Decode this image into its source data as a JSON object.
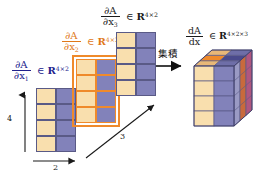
{
  "figure": {
    "type": "tensor-derivative-diagram",
    "background": "#ffffff",
    "colors": {
      "cell_tan": "#f9dfae",
      "cell_purple": "#8282ba",
      "cell_border": "#5a5a86",
      "label_blue": "#20208c",
      "label_orange": "#e07818",
      "highlight_orange": "#ef8a2b",
      "arrow_black": "#1a1a1a"
    }
  },
  "labels": {
    "slice1": {
      "num": "∂A",
      "den_d": "∂x",
      "den_sub": "1",
      "in": "∈",
      "set": "R",
      "dims": "4×2",
      "color": "#20208c"
    },
    "slice2": {
      "num": "∂A",
      "den_d": "∂x",
      "den_sub": "2",
      "in": "∈",
      "set": "R",
      "dims": "4×2",
      "color": "#e07818"
    },
    "slice3": {
      "num": "∂A",
      "den_d": "∂x",
      "den_sub": "3",
      "in": "∈",
      "set": "R",
      "dims": "4×2",
      "color": "#1a1a1a"
    },
    "tensor": {
      "num": "dA",
      "den": "dx",
      "in": "∈",
      "set": "R",
      "dims": "4×2×3",
      "color": "#1a1a1a"
    }
  },
  "operation": {
    "name": "accumulate-arrow",
    "text": "集積"
  },
  "axes": [
    {
      "name": "vertical-axis",
      "label": "4",
      "direction": "up"
    },
    {
      "name": "horizontal-axis",
      "label": "2",
      "direction": "right"
    },
    {
      "name": "depth-axis",
      "label": "3",
      "direction": "up-right"
    }
  ],
  "matrices": [
    {
      "name": "matrix-dx1",
      "rows": 4,
      "cols": 2,
      "highlighted": false,
      "columns": [
        "tan",
        "purple"
      ]
    },
    {
      "name": "matrix-dx2",
      "rows": 4,
      "cols": 2,
      "highlighted": true,
      "columns": [
        "tan",
        "purple"
      ]
    },
    {
      "name": "matrix-dx3",
      "rows": 4,
      "cols": 2,
      "highlighted": false,
      "columns": [
        "tan",
        "purple"
      ]
    }
  ],
  "tensor_block": {
    "name": "tensor-3d",
    "shape": [
      4,
      2,
      3
    ],
    "front_columns": [
      "tan",
      "purple"
    ],
    "front_rows": 4,
    "depth_slices": 3
  }
}
